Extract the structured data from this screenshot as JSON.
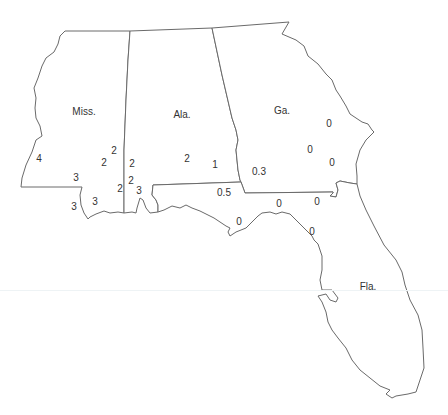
{
  "map": {
    "title": "",
    "states": [
      {
        "name": "Miss.",
        "x": 84,
        "y": 112
      },
      {
        "name": "Ala.",
        "x": 182,
        "y": 115
      },
      {
        "name": "Ga.",
        "x": 282,
        "y": 111
      },
      {
        "name": "Fla.",
        "x": 368,
        "y": 287
      }
    ],
    "values": [
      {
        "label": "4",
        "x": 39,
        "y": 159,
        "state": "Miss."
      },
      {
        "label": "2",
        "x": 114,
        "y": 151,
        "state": "Miss."
      },
      {
        "label": "2",
        "x": 104,
        "y": 163,
        "state": "Miss."
      },
      {
        "label": "3",
        "x": 76,
        "y": 178,
        "state": "Miss."
      },
      {
        "label": "3",
        "x": 74,
        "y": 207,
        "state": "Miss."
      },
      {
        "label": "3",
        "x": 95,
        "y": 202,
        "state": "Miss."
      },
      {
        "label": "2",
        "x": 120,
        "y": 189,
        "state": "Miss."
      },
      {
        "label": "2",
        "x": 132,
        "y": 164,
        "state": "Ala."
      },
      {
        "label": "2",
        "x": 131,
        "y": 181,
        "state": "Ala."
      },
      {
        "label": "3",
        "x": 139,
        "y": 191,
        "state": "Ala."
      },
      {
        "label": "2",
        "x": 187,
        "y": 159,
        "state": "Ala."
      },
      {
        "label": "1",
        "x": 215,
        "y": 165,
        "state": "Ala."
      },
      {
        "label": "0.3",
        "x": 259,
        "y": 172,
        "state": "Ga."
      },
      {
        "label": "0",
        "x": 329,
        "y": 124,
        "state": "Ga."
      },
      {
        "label": "0",
        "x": 310,
        "y": 150,
        "state": "Ga."
      },
      {
        "label": "0",
        "x": 332,
        "y": 163,
        "state": "Ga."
      },
      {
        "label": "0.5",
        "x": 224,
        "y": 193,
        "state": "Fla."
      },
      {
        "label": "0",
        "x": 239,
        "y": 222,
        "state": "Fla."
      },
      {
        "label": "0",
        "x": 279,
        "y": 204,
        "state": "Fla."
      },
      {
        "label": "0",
        "x": 317,
        "y": 202,
        "state": "Fla."
      },
      {
        "label": "0",
        "x": 312,
        "y": 232,
        "state": "Fla."
      }
    ]
  }
}
